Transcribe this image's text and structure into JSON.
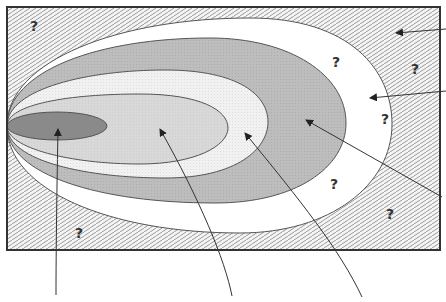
{
  "diagram": {
    "type": "nested-ellipse-zones",
    "zones": [
      {
        "id": "outer-hatched-region",
        "fill": "hatched"
      },
      {
        "id": "white-ring",
        "fill": "#ffffff"
      },
      {
        "id": "grey-ring",
        "fill": "#b8b8b8"
      },
      {
        "id": "light-dotted-ring",
        "fill": "#f0f0f0"
      },
      {
        "id": "mid-grey-ellipse",
        "fill": "#d6d6d6"
      },
      {
        "id": "dark-core-ellipse",
        "fill": "#8c8c8c"
      }
    ],
    "question_marks": [
      {
        "text": "?",
        "x": 30,
        "y": 19
      },
      {
        "text": "?",
        "x": 332,
        "y": 55
      },
      {
        "text": "?",
        "x": 411,
        "y": 62
      },
      {
        "text": "?",
        "x": 381,
        "y": 112
      },
      {
        "text": "?",
        "x": 330,
        "y": 177
      },
      {
        "text": "?",
        "x": 386,
        "y": 207
      },
      {
        "text": "?",
        "x": 75,
        "y": 226
      }
    ],
    "arrows_count": 6,
    "colors": {
      "frame": "#333333",
      "hatch_line": "#9a9a9a",
      "grey_ring": "#b5b5b5",
      "mid_ellipse": "#d4d4d4",
      "light_ring": "#efefef",
      "dark_core": "#888888"
    }
  }
}
